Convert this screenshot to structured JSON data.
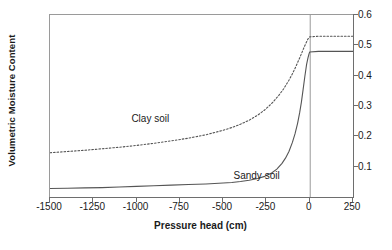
{
  "chart_data": {
    "type": "line",
    "title": "",
    "xlabel": "Pressure head (cm)",
    "ylabel": "Volumetric Moisture Content",
    "xlim": [
      -1500,
      250
    ],
    "ylim": [
      0,
      0.6
    ],
    "grid": false,
    "legend_position": "inline-annotation",
    "xticks": [
      -1500,
      -1250,
      -1000,
      -750,
      -500,
      -250,
      0,
      250
    ],
    "xtick_labels": [
      "-1500",
      "-1250",
      "-1000",
      "-750",
      "-500",
      "-250",
      "0",
      "250"
    ],
    "yticks": [
      0.1,
      0.2,
      0.3,
      0.4,
      0.5,
      0.6
    ],
    "ytick_labels": [
      "0.1",
      "0.2",
      "0.3",
      "0.4",
      "0.5",
      "0.6"
    ],
    "y_axis_side": "right",
    "annotations": [
      {
        "text": "Clay soil",
        "x": -1030,
        "y": 0.255
      },
      {
        "text": "Sandy soil",
        "x": -440,
        "y": 0.065
      }
    ],
    "vertical_reference_line": {
      "x": 0,
      "color": "#9a9a9a"
    },
    "series": [
      {
        "name": "Clay soil",
        "style": "dotted",
        "color": "#555555",
        "saturation_value": 0.53,
        "x": [
          -1500,
          -1400,
          -1300,
          -1200,
          -1100,
          -1000,
          -900,
          -800,
          -700,
          -600,
          -500,
          -450,
          -400,
          -350,
          -300,
          -260,
          -220,
          -180,
          -150,
          -120,
          -100,
          -80,
          -60,
          -45,
          -30,
          -20,
          -10,
          0,
          50,
          120,
          250
        ],
        "values": [
          0.146,
          0.15,
          0.154,
          0.159,
          0.164,
          0.17,
          0.177,
          0.185,
          0.194,
          0.205,
          0.22,
          0.229,
          0.24,
          0.253,
          0.27,
          0.287,
          0.308,
          0.334,
          0.357,
          0.385,
          0.406,
          0.43,
          0.456,
          0.476,
          0.497,
          0.509,
          0.521,
          0.528,
          0.53,
          0.53,
          0.53
        ]
      },
      {
        "name": "Sandy soil",
        "style": "solid",
        "color": "#555555",
        "saturation_value": 0.48,
        "x": [
          -1500,
          -1400,
          -1300,
          -1200,
          -1100,
          -1000,
          -900,
          -800,
          -700,
          -600,
          -500,
          -450,
          -400,
          -350,
          -300,
          -260,
          -220,
          -190,
          -160,
          -140,
          -120,
          -100,
          -85,
          -70,
          -58,
          -48,
          -38,
          -28,
          -18,
          -10,
          -4,
          0,
          50,
          120,
          250
        ],
        "values": [
          0.028,
          0.029,
          0.03,
          0.031,
          0.033,
          0.035,
          0.037,
          0.039,
          0.041,
          0.043,
          0.046,
          0.048,
          0.051,
          0.055,
          0.061,
          0.068,
          0.079,
          0.092,
          0.111,
          0.128,
          0.15,
          0.18,
          0.208,
          0.243,
          0.278,
          0.313,
          0.355,
          0.398,
          0.437,
          0.459,
          0.472,
          0.478,
          0.48,
          0.48,
          0.48
        ]
      }
    ]
  },
  "axes": {
    "y_title": "Volumetric Moisture Content",
    "x_title": "Pressure head (cm)"
  }
}
